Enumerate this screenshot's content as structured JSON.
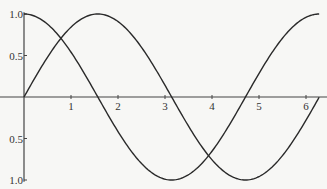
{
  "chart_data": {
    "type": "line",
    "title": "",
    "xlabel": "",
    "ylabel": "",
    "xlim": [
      0,
      6.28
    ],
    "ylim": [
      -1,
      1
    ],
    "grid": false,
    "legend": null,
    "x_ticks": [
      "1",
      "2",
      "3",
      "4",
      "5",
      "6"
    ],
    "y_ticks": [
      {
        "value": 1.0,
        "label": "1.0"
      },
      {
        "value": 0.5,
        "label": "0.5"
      },
      {
        "value": -0.5,
        "label": "0.5"
      },
      {
        "value": -1.0,
        "label": "1.0"
      }
    ],
    "series": [
      {
        "name": "sin(x)",
        "function": "sin",
        "x_range": [
          0,
          6.28
        ]
      },
      {
        "name": "cos(x)",
        "function": "cos",
        "x_range": [
          0,
          6.28
        ]
      }
    ]
  },
  "colors": {
    "line": "#2a2a2a",
    "axis": "#444444",
    "background": "#f7f7f5"
  }
}
